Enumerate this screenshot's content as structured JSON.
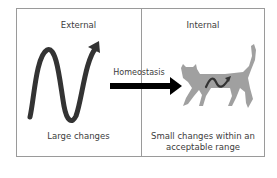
{
  "diagram": {
    "panels": [
      {
        "title": "External",
        "caption": "Large changes",
        "icon": "large-wave-icon"
      },
      {
        "title": "Internal",
        "caption_line1": "Small changes within an",
        "caption_line2": "acceptable range",
        "icon": "cat-icon"
      }
    ],
    "arrow": {
      "label": "Homeostasis",
      "icon": "right-arrow-icon"
    },
    "colors": {
      "wave": "#333333",
      "arrow": "#000000",
      "cat": "#9e9e9e",
      "border": "#9a9a9a"
    }
  }
}
